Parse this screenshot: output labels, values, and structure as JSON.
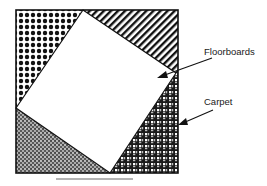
{
  "diagram": {
    "labels": {
      "floorboards": "Floorboards",
      "carpet": "Carpet"
    },
    "regions": [
      {
        "name": "top-left-corner",
        "pattern": "dots"
      },
      {
        "name": "top-right-corner",
        "pattern": "diagonal-stripes"
      },
      {
        "name": "bottom-left-corner",
        "pattern": "fine-speckle"
      },
      {
        "name": "bottom-right-corner",
        "pattern": "checker-grid"
      },
      {
        "name": "center-rotated-square",
        "pattern": "white"
      }
    ],
    "colors": {
      "ink": "#1a1a1a",
      "paper": "#ffffff",
      "underline": "#9a9a9a"
    }
  }
}
